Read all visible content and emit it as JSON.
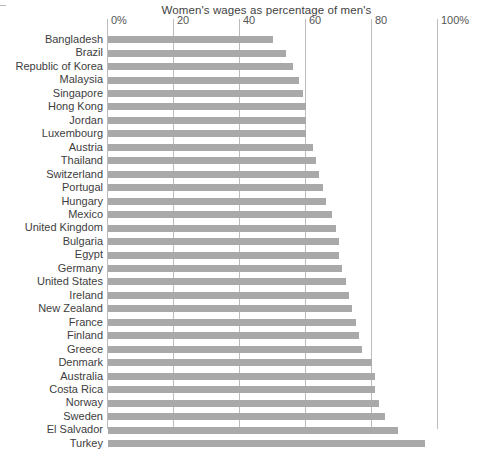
{
  "chart_data": {
    "type": "bar",
    "orientation": "horizontal",
    "title": "Women's wages as percentage of men's",
    "xlabel": "",
    "ylabel": "",
    "xlim": [
      0,
      100
    ],
    "grid": true,
    "legend": "none",
    "bar_color": "#a9a9a9",
    "gridline_color": "#bcbcbc",
    "tick_labels": [
      "0%",
      "20",
      "40",
      "60",
      "80",
      "100%"
    ],
    "ticks": [
      0,
      20,
      40,
      60,
      80,
      100
    ],
    "categories": [
      "Bangladesh",
      "Brazil",
      "Republic of Korea",
      "Malaysia",
      "Singapore",
      "Hong Kong",
      "Jordan",
      "Luxembourg",
      "Austria",
      "Thailand",
      "Switzerland",
      "Portugal",
      "Hungary",
      "Mexico",
      "United Kingdom",
      "Bulgaria",
      "Egypt",
      "Germany",
      "United States",
      "Ireland",
      "New Zealand",
      "France",
      "Finland",
      "Greece",
      "Denmark",
      "Australia",
      "Costa Rica",
      "Norway",
      "Sweden",
      "El Salvador",
      "Turkey"
    ],
    "values": [
      50,
      54,
      56,
      58,
      59,
      60,
      60,
      60,
      62,
      63,
      64,
      65,
      66,
      68,
      69,
      70,
      70,
      71,
      72,
      73,
      74,
      75,
      76,
      77,
      80,
      81,
      81,
      82,
      84,
      88,
      96
    ]
  },
  "axis": {
    "tick_0": "0%",
    "tick_20": "20",
    "tick_40": "40",
    "tick_60": "60",
    "tick_80": "80",
    "tick_100": "100%"
  }
}
